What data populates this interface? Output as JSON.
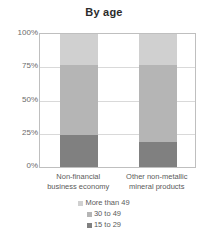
{
  "chart_data": {
    "type": "bar",
    "subtype": "100% stacked column",
    "title": "By age",
    "xlabel": "",
    "ylabel": "",
    "ylim": [
      0,
      100
    ],
    "yticks": [
      "0%",
      "25%",
      "50%",
      "75%",
      "100%"
    ],
    "ytick_values": [
      0,
      25,
      50,
      75,
      100
    ],
    "grid": true,
    "legend_position": "bottom",
    "categories": [
      "Non-financial business economy",
      "Other non-metallic mineral products"
    ],
    "category_lines": [
      [
        "Non-financial",
        "business economy"
      ],
      [
        "Other non-metallic",
        "mineral products"
      ]
    ],
    "series": [
      {
        "name": "More than 49",
        "values": [
          23,
          23
        ],
        "color": "#d0d0d0"
      },
      {
        "name": "30 to 49",
        "values": [
          53,
          58
        ],
        "color": "#b5b5b5"
      },
      {
        "name": "15 to 29",
        "values": [
          24,
          19
        ],
        "color": "#808080"
      }
    ],
    "stack_order_bottom_to_top": [
      "15 to 29",
      "30 to 49",
      "More than 49"
    ]
  }
}
